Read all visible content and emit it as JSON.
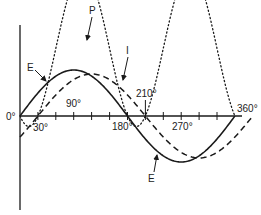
{
  "diagram": {
    "title": "",
    "axis": {
      "x_ticks": [
        "0°",
        "30°",
        "90°",
        "180°",
        "210°",
        "270°",
        "360°"
      ]
    },
    "curves": [
      {
        "name": "E",
        "style": "solid",
        "description": "voltage",
        "phase_deg": 0
      },
      {
        "name": "I",
        "style": "dashed",
        "description": "current",
        "phase_deg": -30
      },
      {
        "name": "P",
        "style": "dotted",
        "description": "power",
        "phase_deg": 0
      }
    ],
    "labels": {
      "P": "P",
      "I": "I",
      "E_top": "E",
      "E_bottom": "E",
      "zero": "0°",
      "t30": "30°",
      "t90": "90°",
      "t180": "180°",
      "t210": "210°",
      "t270": "270°",
      "t360": "360°"
    },
    "colors": {
      "line": "#1a1a1a"
    }
  }
}
